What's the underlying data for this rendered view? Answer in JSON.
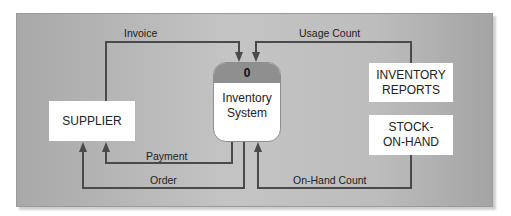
{
  "diagram": {
    "type": "context data flow diagram",
    "process": {
      "number": "0",
      "name_line1": "Inventory",
      "name_line2": "System"
    },
    "entities": {
      "supplier": "SUPPLIER",
      "inventory_reports_line1": "INVENTORY",
      "inventory_reports_line2": "REPORTS",
      "stock_line1": "STOCK-",
      "stock_line2": "ON-HAND"
    },
    "flows": {
      "invoice": "Invoice",
      "usage_count": "Usage Count",
      "payment": "Payment",
      "order": "Order",
      "on_hand_count": "On-Hand Count"
    },
    "colors": {
      "line": "#4a4a4a",
      "panel": "#bdbdbd",
      "process_header": "#8f8f8f"
    }
  }
}
